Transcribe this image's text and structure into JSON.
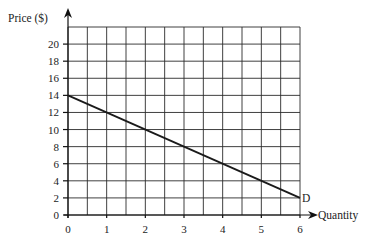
{
  "chart_data": {
    "type": "line",
    "title": "",
    "xlabel": "Quantity",
    "ylabel": "Price ($)",
    "xlim": [
      0,
      6
    ],
    "ylim": [
      0,
      22
    ],
    "x_ticks": [
      0,
      1,
      2,
      3,
      4,
      5,
      6
    ],
    "y_ticks": [
      0,
      2,
      4,
      6,
      8,
      10,
      12,
      14,
      16,
      18,
      20
    ],
    "grid": true,
    "grid_x_step": 0.5,
    "grid_y_step": 2,
    "legend": null,
    "series": [
      {
        "name": "D",
        "label": "D",
        "x": [
          0,
          6
        ],
        "y": [
          14,
          2
        ]
      }
    ],
    "annotations": [
      {
        "text": "D",
        "x": 6,
        "y": 2
      }
    ]
  },
  "labels": {
    "y_axis": "Price ($)",
    "x_axis": "Quantity",
    "curve": "D"
  }
}
